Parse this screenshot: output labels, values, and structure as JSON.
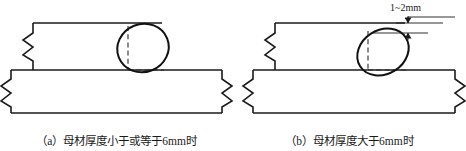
{
  "figure": {
    "type": "technical-drawing",
    "panels": [
      {
        "id": "a",
        "caption": "（a）母材厚度小于或等于6mm时",
        "label": "a",
        "condition_text": "母材厚度小于或等于6mm时",
        "thickness_mm": 6,
        "comparison": "less-than-or-equal",
        "has_gap_dimension": false,
        "bead_style": "oval-upright",
        "geometry": {
          "upper_plate": {
            "left": 33,
            "right": 162,
            "top": 23,
            "bottom": 70
          },
          "lower_plate": {
            "left": 11,
            "right": 222,
            "top": 70,
            "bottom": 113
          },
          "bead_center_x": 143,
          "bead_center_y": 48,
          "bead_rx": 26,
          "bead_ry": 24,
          "bead_rotation_deg": -22
        }
      },
      {
        "id": "b",
        "caption": "（b）母材厚度大于6mm时",
        "label": "b",
        "condition_text": "母材厚度大于6mm时",
        "thickness_mm": 6,
        "comparison": "greater-than",
        "has_gap_dimension": true,
        "bead_style": "oval-tilted-lowered",
        "geometry": {
          "upper_plate": {
            "left": 275,
            "right": 405,
            "top": 23,
            "bottom": 70
          },
          "lower_plate": {
            "left": 253,
            "right": 455,
            "top": 70,
            "bottom": 113
          },
          "bead_center_x": 383,
          "bead_center_y": 52,
          "bead_rx": 27,
          "bead_ry": 22,
          "bead_rotation_deg": -32
        }
      }
    ],
    "dimension": {
      "label": "1~2mm",
      "value_min": 1,
      "value_max": 2,
      "unit": "mm",
      "applies_to_panel": "b",
      "description": "vertical-gap-between-plate-top-and-bead-top"
    },
    "colors": {
      "line": "#1a1a1a",
      "background": "#ffffff",
      "hidden_line": "#4a4a4a",
      "text": "#1a1a1a"
    },
    "line_weights": {
      "outline": 1.6,
      "bead": 2.0,
      "hidden": 1.1,
      "dimension": 0.9
    }
  }
}
